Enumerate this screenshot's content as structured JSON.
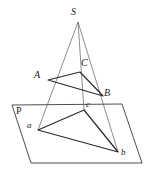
{
  "figure": {
    "type": "solid-geometry-diagram",
    "stroke_color": "#3a3a3a",
    "background_color": "#ffffff",
    "labels": {
      "apex": "S",
      "upper_a": "A",
      "upper_b": "B",
      "upper_c": "C",
      "lower_a": "a",
      "lower_b": "b",
      "lower_c": "c",
      "plane": "P"
    },
    "points": {
      "S": {
        "x": 78,
        "y": 22
      },
      "A": {
        "x": 48,
        "y": 80
      },
      "B": {
        "x": 103,
        "y": 96
      },
      "C": {
        "x": 80,
        "y": 72
      },
      "a": {
        "x": 38,
        "y": 130
      },
      "b": {
        "x": 118,
        "y": 152
      },
      "c": {
        "x": 84,
        "y": 110
      },
      "P1": {
        "x": 12,
        "y": 105
      },
      "P2": {
        "x": 122,
        "y": 104
      },
      "P3": {
        "x": 142,
        "y": 163
      },
      "P4": {
        "x": 31,
        "y": 163
      }
    },
    "label_positions": {
      "S": {
        "x": 71,
        "y": 7
      },
      "A": {
        "x": 34,
        "y": 70
      },
      "B": {
        "x": 104,
        "y": 88
      },
      "C": {
        "x": 81,
        "y": 58
      },
      "a": {
        "x": 27,
        "y": 121
      },
      "b": {
        "x": 121,
        "y": 148
      },
      "c": {
        "x": 86,
        "y": 100
      },
      "P": {
        "x": 16,
        "y": 106
      }
    },
    "edges": [
      {
        "name": "ray-S-to-a",
        "from": "S",
        "to": "a"
      },
      {
        "name": "ray-S-to-b",
        "from": "S",
        "to": "b"
      },
      {
        "name": "ray-S-to-c",
        "from": "S",
        "to": "c"
      },
      {
        "name": "segment-A-B",
        "from": "A",
        "to": "B"
      },
      {
        "name": "segment-B-C",
        "from": "B",
        "to": "C"
      },
      {
        "name": "segment-C-A",
        "from": "C",
        "to": "A"
      },
      {
        "name": "segment-a-b",
        "from": "a",
        "to": "b"
      },
      {
        "name": "segment-b-c",
        "from": "b",
        "to": "c"
      },
      {
        "name": "segment-c-a",
        "from": "c",
        "to": "a"
      },
      {
        "name": "plane-edge-top",
        "from": "P1",
        "to": "P2"
      },
      {
        "name": "plane-edge-right",
        "from": "P2",
        "to": "P3"
      },
      {
        "name": "plane-edge-bottom",
        "from": "P3",
        "to": "P4"
      },
      {
        "name": "plane-edge-left",
        "from": "P4",
        "to": "P1"
      }
    ]
  }
}
